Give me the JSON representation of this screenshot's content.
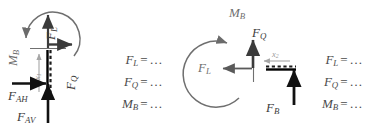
{
  "figure": {
    "kind": "free-body-diagram-pair",
    "background_color": "#ffffff",
    "ink_color": "#4a4a4a",
    "beam_color": "#000000",
    "dim_color": "#9a9a9a"
  },
  "diagram_left": {
    "name": "vertical-member-free-body-diagram",
    "labels": {
      "force_longitudinal": "F",
      "force_longitudinal_sub": "L",
      "force_shear": "F",
      "force_shear_sub": "Q",
      "moment": "M",
      "moment_sub": "B",
      "reaction_horizontal": "F",
      "reaction_horizontal_sub": "AH",
      "reaction_vertical": "F",
      "reaction_vertical_sub": "AV",
      "dimension": "x",
      "dimension_sub": "1"
    }
  },
  "equations_left": {
    "name": "equation-column-left",
    "rows": [
      {
        "lhs": "F",
        "sub": "L",
        "op": "=",
        "rhs": "…"
      },
      {
        "lhs": "F",
        "sub": "Q",
        "op": "=",
        "rhs": "…"
      },
      {
        "lhs": "M",
        "sub": "B",
        "op": "=",
        "rhs": "…"
      }
    ]
  },
  "diagram_right": {
    "name": "horizontal-member-free-body-diagram",
    "labels": {
      "moment": "M",
      "moment_sub": "B",
      "force_shear": "F",
      "force_shear_sub": "Q",
      "force_longitudinal": "F",
      "force_longitudinal_sub": "L",
      "reaction_support": "F",
      "reaction_support_sub": "B",
      "dimension": "x",
      "dimension_sub": "2"
    }
  },
  "equations_right": {
    "name": "equation-column-right",
    "rows": [
      {
        "lhs": "F",
        "sub": "L",
        "op": "=",
        "rhs": "…"
      },
      {
        "lhs": "F",
        "sub": "Q",
        "op": "=",
        "rhs": "…"
      },
      {
        "lhs": "M",
        "sub": "B",
        "op": "=",
        "rhs": "…"
      }
    ]
  }
}
